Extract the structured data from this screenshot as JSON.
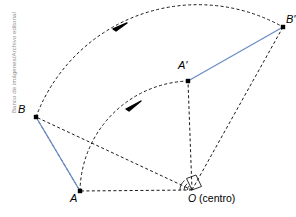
{
  "figure": {
    "type": "geometry-diagram",
    "credit": "Banco de imágenes/Archivo editorial",
    "colors": {
      "segment_blue": "#6b8dc4",
      "construction_dash": "#1a1a1a",
      "point_fill": "#000000",
      "background": "#ffffff",
      "credit_gray": "#8d8d8d"
    },
    "points": [
      {
        "id": "A",
        "label": "A",
        "x": 80,
        "y": 191,
        "label_x": 74,
        "label_y": 196
      },
      {
        "id": "B",
        "label": "B",
        "x": 36,
        "y": 117,
        "label_x": 21,
        "label_y": 106
      },
      {
        "id": "Ap",
        "label": "A'",
        "x": 188,
        "y": 81,
        "label_x": 180,
        "label_y": 63
      },
      {
        "id": "Bp",
        "label": "B'",
        "x": 283,
        "y": 27,
        "label_x": 282,
        "label_y": 17
      },
      {
        "id": "O",
        "label": "O",
        "x": 192,
        "y": 190,
        "label_x": 192,
        "label_y": 196
      }
    ],
    "origin": {
      "symbol": "O",
      "annotation": "(centro)",
      "full_label": "O (centro)"
    },
    "segments": [
      {
        "name": "AB",
        "from": "B",
        "to": "A",
        "style": "solid",
        "color": "#6b8dc4"
      },
      {
        "name": "A'B'",
        "from": "Ap",
        "to": "Bp",
        "style": "solid",
        "color": "#6b8dc4"
      }
    ],
    "radii": [
      {
        "name": "OA",
        "from": "O",
        "to": "A",
        "style": "dashed"
      },
      {
        "name": "OB",
        "from": "O",
        "to": "B",
        "style": "dashed"
      },
      {
        "name": "OA'",
        "from": "O",
        "to": "Ap",
        "style": "dashed"
      },
      {
        "name": "OB'",
        "from": "O",
        "to": "Bp",
        "style": "dashed"
      }
    ],
    "construction_lines": [
      {
        "name": "BA-dashed",
        "from": "B",
        "to": "A",
        "style": "dashed"
      }
    ],
    "arcs": [
      {
        "name": "arc-B-to-B'",
        "from": "B",
        "to": "Bp",
        "style": "dashed",
        "arrow": true,
        "arrow_x": 120,
        "arrow_y": 26
      },
      {
        "name": "arc-A-to-A'",
        "from": "A",
        "to": "Ap",
        "style": "dashed",
        "arrow": true,
        "arrow_x": 133,
        "arrow_y": 105
      }
    ],
    "angle_marker": {
      "name": "rotation-angle-at-O",
      "at": "O",
      "style": "arc-fan"
    }
  }
}
